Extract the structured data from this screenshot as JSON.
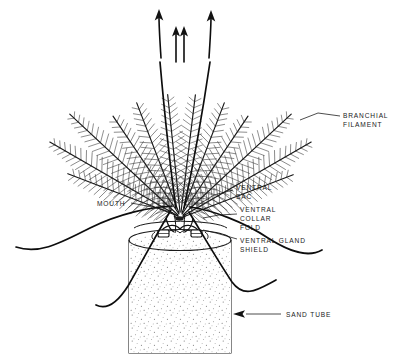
{
  "figure": {
    "style": "black and white ink line drawing",
    "background_color": "#ffffff",
    "ink_color": "#121212",
    "width": 397,
    "height": 361
  },
  "labels": [
    {
      "id": "branchial-filament",
      "line1": "BRANCHIAL",
      "line2": "FILAMENT",
      "text_x": 343,
      "text_y": 118,
      "leader": "M 340 116 L 317 114 L 299 119"
    },
    {
      "id": "mouth",
      "line1": "MOUTH",
      "line2": "",
      "text_x": 97,
      "text_y": 205,
      "leader": "M 131 203 L 160 209 L 174 214"
    },
    {
      "id": "ventral-sac",
      "line1": "VENTRAL",
      "line2": "SAC",
      "text_x": 236,
      "text_y": 190,
      "leader": "M 233 192 L 215 196 L 198 206"
    },
    {
      "id": "ventral-collar-fold",
      "line1": "VENTRAL",
      "line2": "COLLAR",
      "line3": "FOLD",
      "text_x": 240,
      "text_y": 208,
      "leader": "M 237 215 L 218 216 L 201 218"
    },
    {
      "id": "ventral-gland-shield",
      "line1": "VENTRAL GLAND",
      "line2": "SHIELD",
      "text_x": 240,
      "text_y": 243,
      "leader": "M 237 240 L 215 233 L 197 228"
    },
    {
      "id": "sand-tube",
      "line1": "SAND TUBE",
      "line2": "",
      "text_x": 284,
      "text_y": 317,
      "leader": "M 280 314 L 245 314 L 234 314"
    }
  ],
  "annotations": {
    "water_current_arrows": 4,
    "arrow_meaning": "direction of exhalant water current"
  },
  "anatomy": {
    "branchial_crown": {
      "plume_count": 10,
      "description": "pinnate branchial filaments radiating in a fan"
    },
    "feeding_tentacles": {
      "count": 4,
      "description": "long slender grooved tentacles sweeping outward and downward"
    },
    "sand_tube": {
      "texture": "stippled sand grains",
      "top_y": 235,
      "left_x": 128,
      "right_x": 232
    }
  }
}
